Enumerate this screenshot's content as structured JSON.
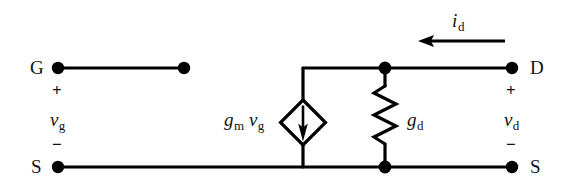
{
  "diagram": {
    "type": "small-signal-equivalent-circuit",
    "background_color": "#ffffff",
    "line_color": "#000000",
    "terminals": {
      "gate": "G",
      "drain": "D",
      "source_left": "S",
      "source_right": "S"
    },
    "labels": {
      "gate_plus": "+",
      "gate_minus": "−",
      "gate_voltage": "v",
      "gate_voltage_sub": "g",
      "drain_plus": "+",
      "drain_minus": "−",
      "drain_voltage": "v",
      "drain_voltage_sub": "d",
      "drain_current": "i",
      "drain_current_sub": "d",
      "transconductance": "g",
      "transconductance_sub": "m",
      "controlling_voltage": "v",
      "controlling_voltage_sub": "g",
      "output_conductance": "g",
      "output_conductance_sub": "d"
    },
    "components": {
      "dependent_source": {
        "name": "voltage-controlled-current-source",
        "shape": "diamond",
        "arrow_direction": "down"
      },
      "conductance": {
        "name": "output-conductance-resistor",
        "shape": "zigzag"
      },
      "current_arrow": {
        "name": "drain-current-arrow",
        "direction": "left"
      }
    }
  }
}
